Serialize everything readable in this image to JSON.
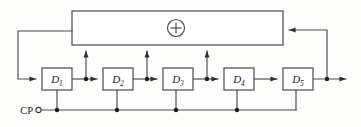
{
  "diagram": {
    "kind": "logic-circuit-schematic",
    "canvas": {
      "width": 361,
      "height": 127
    },
    "colors": {
      "background": "#fdfdfc",
      "wire": "#4a4a4a",
      "box_fill": "#ffffff",
      "box_stroke": "#4a4a4a",
      "label": "#1a1a1a",
      "junction": "#1d1d1d"
    },
    "flipflops": [
      {
        "id": "d1",
        "label": "D",
        "subscript": "1",
        "x": 42,
        "y": 68,
        "w": 30,
        "h": 22
      },
      {
        "id": "d2",
        "label": "D",
        "subscript": "2",
        "x": 103,
        "y": 68,
        "w": 30,
        "h": 22
      },
      {
        "id": "d3",
        "label": "D",
        "subscript": "3",
        "x": 163,
        "y": 68,
        "w": 30,
        "h": 22
      },
      {
        "id": "d4",
        "label": "D",
        "subscript": "4",
        "x": 224,
        "y": 68,
        "w": 30,
        "h": 22
      },
      {
        "id": "d5",
        "label": "D",
        "subscript": "5",
        "x": 283,
        "y": 68,
        "w": 30,
        "h": 22
      }
    ],
    "xor_gate": {
      "symbol": "+",
      "name": "modulo-2-adder",
      "cx": 176,
      "cy": 28,
      "r": 8.5
    },
    "feedback_bus": {
      "x": 72,
      "y": 11,
      "w": 211,
      "h": 34
    },
    "clock": {
      "label": "CP",
      "label_x": 33,
      "label_y": 113,
      "terminal_x": 38.5,
      "terminal_y": 110,
      "terminal_r": 2.6,
      "line_y": 110,
      "line_x_start": 41,
      "line_x_end": 296
    },
    "tap_points_x": [
      86,
      147,
      207
    ],
    "junctions": [
      {
        "name": "tap-junction-1",
        "x": 86,
        "y": 79
      },
      {
        "name": "tap-junction-2",
        "x": 147,
        "y": 79
      },
      {
        "name": "tap-junction-3",
        "x": 207,
        "y": 79
      },
      {
        "name": "output-junction",
        "x": 327,
        "y": 79
      },
      {
        "name": "clock-junction-1",
        "x": 57,
        "y": 110
      },
      {
        "name": "clock-junction-2",
        "x": 117,
        "y": 110
      },
      {
        "name": "clock-junction-3",
        "x": 176,
        "y": 110
      },
      {
        "name": "clock-junction-4",
        "x": 237,
        "y": 110
      }
    ],
    "signal_row_y": 79,
    "output_arrow_x": 352,
    "return_path_x": 327
  }
}
